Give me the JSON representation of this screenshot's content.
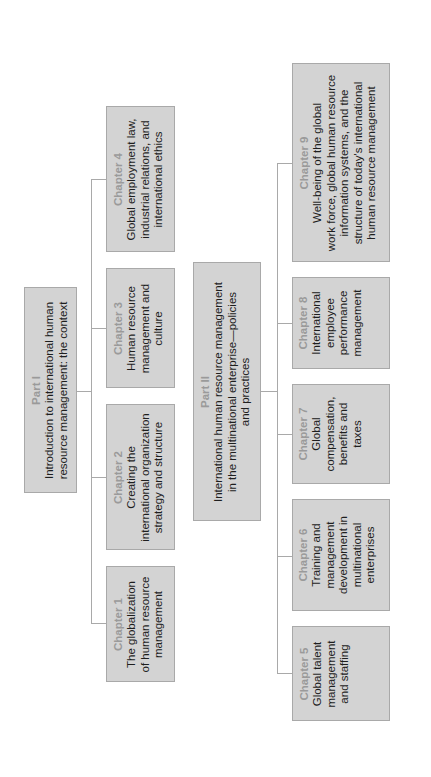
{
  "diagram": {
    "type": "tree-structure",
    "orientation": "rotated-90-ccw",
    "colors": {
      "box_fill": "#d3d3d3",
      "box_border": "#a9a9a9",
      "label": "#9a9a9a",
      "text": "#1e1e1e",
      "connector": "#a9a9a9"
    },
    "parts": [
      {
        "label": "Part I",
        "lines": [
          "Introduction to international human",
          "resource management: the context"
        ],
        "chapters": [
          {
            "label": "Chapter 1",
            "lines": [
              "The globalization",
              "of human resource",
              "management"
            ]
          },
          {
            "label": "Chapter 2",
            "lines": [
              "Creating the",
              "international organization",
              "strategy and structure"
            ]
          },
          {
            "label": "Chapter 3",
            "lines": [
              "Human resource",
              "management and",
              "culture"
            ]
          },
          {
            "label": "Chapter 4",
            "lines": [
              "Global employment law,",
              "industrial relations, and",
              "international ethics"
            ]
          }
        ]
      },
      {
        "label": "Part II",
        "lines": [
          "International human resource management",
          "in the multinational enterprise—policies",
          "and practices"
        ],
        "chapters": [
          {
            "label": "Chapter 5",
            "lines": [
              "Global talent",
              "management",
              "and staffing"
            ]
          },
          {
            "label": "Chapter 6",
            "lines": [
              "Training and",
              "management",
              "development in",
              "multinational",
              "enterprises"
            ]
          },
          {
            "label": "Chapter 7",
            "lines": [
              "Global",
              "compensation,",
              "benefits and",
              "taxes"
            ]
          },
          {
            "label": "Chapter 8",
            "lines": [
              "International",
              "employee",
              "performance",
              "management"
            ]
          },
          {
            "label": "Chapter 9",
            "lines": [
              "Well-being of the global",
              "work force, global human resource",
              "information systems, and the",
              "structure of today's international",
              "human resource management"
            ]
          }
        ]
      }
    ]
  }
}
